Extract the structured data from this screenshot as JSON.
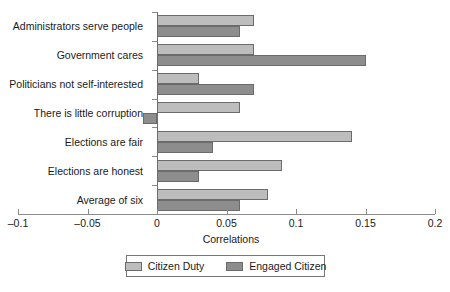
{
  "chart_data": {
    "type": "bar",
    "orientation": "horizontal",
    "title": "",
    "xlabel": "Correlations",
    "ylabel": "",
    "xlim": [
      -0.1,
      0.2
    ],
    "xticks": [
      -0.1,
      -0.05,
      0,
      0.05,
      0.1,
      0.15,
      0.2
    ],
    "xtick_labels": [
      "–0.1",
      "–0.05",
      "0",
      "0.05",
      "0.1",
      "0.15",
      "0.2"
    ],
    "grid": false,
    "legend_position": "bottom",
    "categories": [
      "Administrators serve people",
      "Government cares",
      "Politicians not self-interested",
      "There is little corruption",
      "Elections are fair",
      "Elections are honest",
      "Average of six"
    ],
    "series": [
      {
        "name": "Citizen Duty",
        "color": "#bdbdbd",
        "values": [
          0.07,
          0.07,
          0.03,
          0.06,
          0.14,
          0.09,
          0.08
        ]
      },
      {
        "name": "Engaged Citizen",
        "color": "#8d8d8d",
        "values": [
          0.06,
          0.15,
          0.07,
          -0.01,
          0.04,
          0.03,
          0.06
        ]
      }
    ]
  },
  "axis": {
    "x_title": "Correlations"
  },
  "legend": {
    "entries": [
      {
        "label": "Citizen Duty",
        "swatch": "duty"
      },
      {
        "label": "Engaged Citizen",
        "swatch": "engaged"
      }
    ]
  },
  "clipped_title": ""
}
